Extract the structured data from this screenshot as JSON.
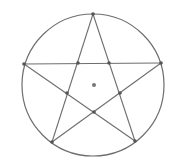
{
  "diagram": {
    "type": "pentagram-in-circle",
    "circle": {
      "cx": 93,
      "cy": 85,
      "r": 71
    },
    "colors": {
      "stroke": "#6e6e6e",
      "point": "#555555",
      "center": "#777777",
      "background": "#ffffff"
    },
    "outer_vertices": [
      {
        "name": "top",
        "x": 93,
        "y": 14
      },
      {
        "name": "right",
        "x": 161,
        "y": 63
      },
      {
        "name": "bottom-right",
        "x": 135,
        "y": 141
      },
      {
        "name": "bottom-left",
        "x": 52,
        "y": 142
      },
      {
        "name": "left",
        "x": 24,
        "y": 64
      }
    ],
    "inner_vertices": [
      {
        "name": "upper-left",
        "x": 78,
        "y": 63
      },
      {
        "name": "upper-right",
        "x": 109,
        "y": 63
      },
      {
        "name": "right",
        "x": 120,
        "y": 93
      },
      {
        "name": "bottom",
        "x": 94,
        "y": 112
      },
      {
        "name": "left",
        "x": 67,
        "y": 93
      }
    ],
    "star_edges": [
      [
        0,
        2
      ],
      [
        2,
        4
      ],
      [
        4,
        1
      ],
      [
        1,
        3
      ],
      [
        3,
        0
      ]
    ],
    "center_point": {
      "x": 94,
      "y": 85,
      "r": 2
    }
  }
}
